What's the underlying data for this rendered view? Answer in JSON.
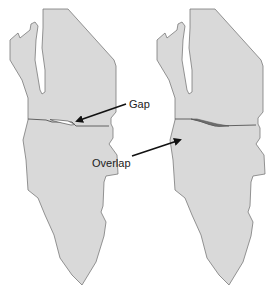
{
  "figure": {
    "colors": {
      "fill": "#d9d9d9",
      "outline": "#7a7a7a",
      "gap_fill": "#ffffff",
      "overlap_fill": "#6e6e6e",
      "arrow": "#111111",
      "text": "#222222"
    }
  },
  "panels": [
    {
      "id": "left",
      "annotation": {
        "label": "Gap"
      }
    },
    {
      "id": "right",
      "annotation": {
        "label": "Overlap"
      }
    }
  ]
}
